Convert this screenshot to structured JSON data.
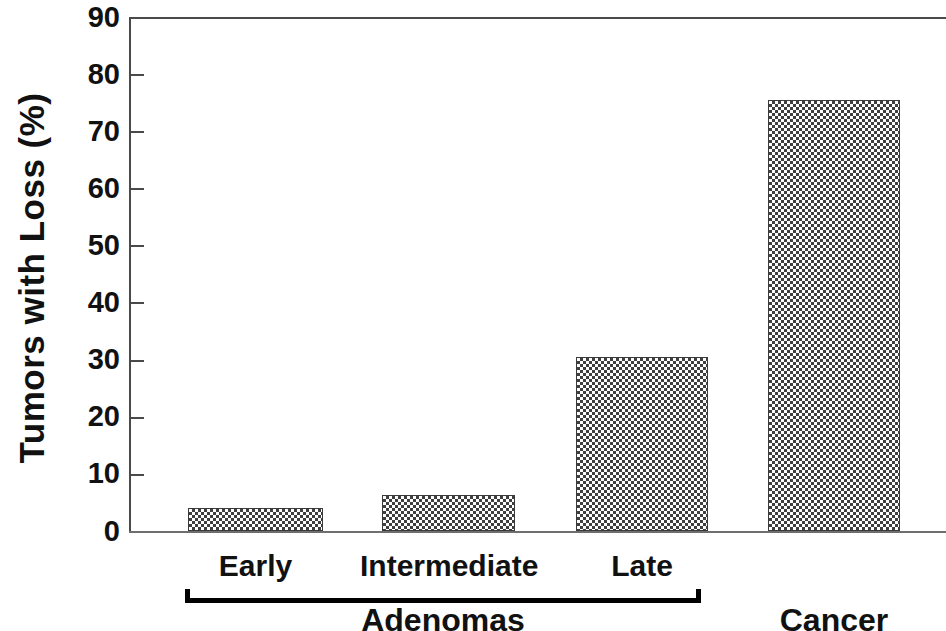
{
  "chart_data": {
    "type": "bar",
    "title": "",
    "xlabel": "",
    "ylabel": "Tumors with Loss (%)",
    "categories": [
      "Early",
      "Intermediate",
      "Late",
      "Cancer"
    ],
    "values": [
      4.0,
      6.3,
      30.5,
      75.5
    ],
    "ylim": [
      0,
      90
    ],
    "ytick_labels": [
      "90",
      "80",
      "70",
      "60",
      "50",
      "40",
      "30",
      "20",
      "10",
      "0"
    ],
    "ytick_values": [
      90,
      80,
      70,
      60,
      50,
      40,
      30,
      20,
      10,
      0
    ],
    "grid": false,
    "legend": null,
    "bar_fill": "checkerboard-dither",
    "bar_color": "#3f3f3f",
    "axis_color": "#4a4a4a",
    "groups": [
      {
        "label": "Adenomas",
        "members": [
          "Early",
          "Intermediate",
          "Late"
        ],
        "bracket": true
      },
      {
        "label": "Cancer",
        "members": [
          "Cancer"
        ],
        "bracket": false
      }
    ]
  },
  "axis": {
    "y_title": "Tumors with Loss (%)",
    "ticks": [
      {
        "label": "90",
        "value": 90
      },
      {
        "label": "80",
        "value": 80
      },
      {
        "label": "70",
        "value": 70
      },
      {
        "label": "60",
        "value": 60
      },
      {
        "label": "50",
        "value": 50
      },
      {
        "label": "40",
        "value": 40
      },
      {
        "label": "30",
        "value": 30
      },
      {
        "label": "20",
        "value": 20
      },
      {
        "label": "10",
        "value": 10
      },
      {
        "label": "0",
        "value": 0
      }
    ]
  },
  "categories": [
    {
      "label": "Early",
      "value": 4.0
    },
    {
      "label": "Intermediate",
      "value": 6.3
    },
    {
      "label": "Late",
      "value": 30.5
    },
    {
      "label": "Cancer",
      "value": 75.5
    }
  ],
  "groups": {
    "adenomas_label": "Adenomas",
    "cancer_label": "Cancer"
  }
}
